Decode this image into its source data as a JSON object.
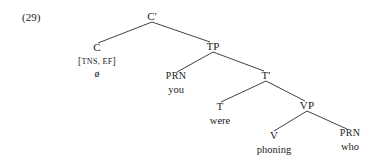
{
  "example": {
    "number": "(29)"
  },
  "tree": {
    "root_label": "C′",
    "nodes": {
      "cbar": {
        "label": "C′"
      },
      "c": {
        "label": "C",
        "features_open": "[",
        "features": "TNS, EF",
        "features_close": "]",
        "terminal": "ø"
      },
      "tp": {
        "label": "TP"
      },
      "prn_subject": {
        "label": "PRN",
        "terminal": "you"
      },
      "tbar": {
        "label": "T′"
      },
      "t": {
        "label": "T",
        "terminal": "were"
      },
      "vp": {
        "label": "VP"
      },
      "v": {
        "label": "V",
        "terminal": "phoning"
      },
      "prn_object": {
        "label": "PRN",
        "terminal": "who"
      }
    },
    "edges": [
      {
        "from": "cbar",
        "to": "c"
      },
      {
        "from": "cbar",
        "to": "tp"
      },
      {
        "from": "tp",
        "to": "prn_subject"
      },
      {
        "from": "tp",
        "to": "tbar"
      },
      {
        "from": "tbar",
        "to": "t"
      },
      {
        "from": "tbar",
        "to": "vp"
      },
      {
        "from": "vp",
        "to": "v"
      },
      {
        "from": "vp",
        "to": "prn_object"
      }
    ],
    "sentence": "ø you were phoning who"
  },
  "style": {
    "line_color": "#2b2b2b",
    "text_color": "#1a1a1a",
    "background": "#ffffff"
  }
}
